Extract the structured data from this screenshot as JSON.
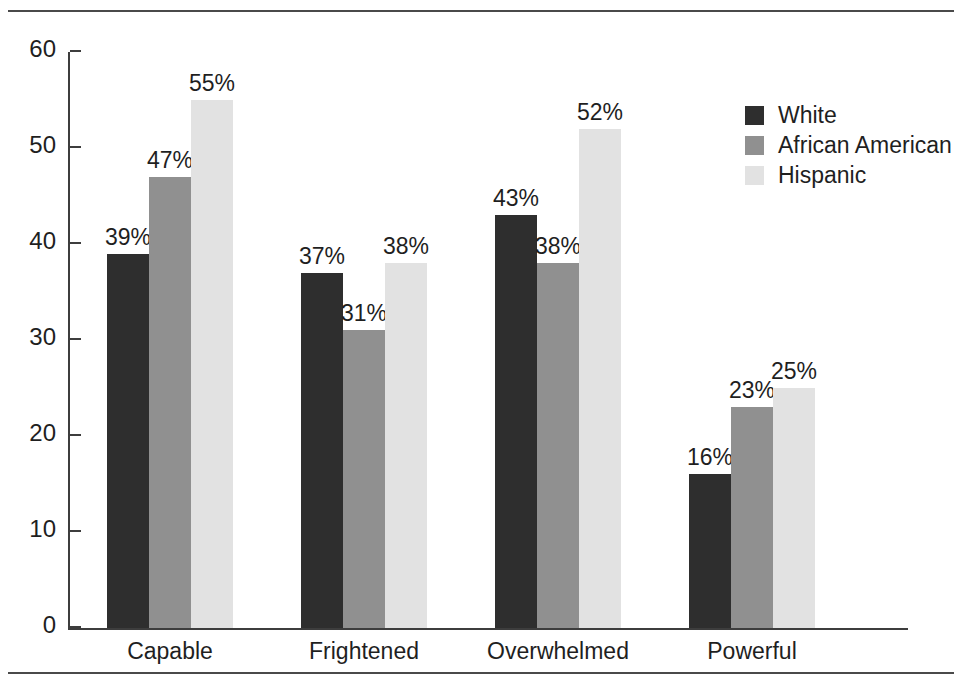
{
  "chart_data": {
    "type": "bar",
    "title": "",
    "subtitle": "",
    "xlabel": "",
    "ylabel": "",
    "ylim": [
      0,
      60
    ],
    "yticks": [
      "0",
      "10",
      "20",
      "30",
      "40",
      "50",
      "60"
    ],
    "grid": false,
    "legend_position": "top-right",
    "value_label_suffix": "%",
    "categories": [
      "Capable",
      "Frightened",
      "Overwhelmed",
      "Powerful"
    ],
    "series": [
      {
        "name": "White",
        "color": "#2e2e2e",
        "values": [
          39,
          37,
          43,
          16
        ],
        "labels": [
          "39%",
          "37%",
          "43%",
          "16%"
        ]
      },
      {
        "name": "African American",
        "color": "#909090",
        "values": [
          47,
          31,
          38,
          23
        ],
        "labels": [
          "47%",
          "31%",
          "38%",
          "23%"
        ]
      },
      {
        "name": "Hispanic",
        "color": "#e2e2e2",
        "values": [
          55,
          38,
          52,
          25
        ],
        "labels": [
          "55%",
          "38%",
          "52%",
          "25%"
        ]
      }
    ]
  },
  "axis": {
    "tick_labels": [
      "60",
      "50",
      "40",
      "30",
      "20",
      "10",
      "0"
    ]
  },
  "legend": {
    "entries": [
      {
        "label": "White",
        "color": "#2e2e2e"
      },
      {
        "label": "African American",
        "color": "#909090"
      },
      {
        "label": "Hispanic",
        "color": "#e2e2e2"
      }
    ]
  },
  "colors": {
    "axis": "#3d3d3d",
    "rule": "#4a4a4a",
    "text": "#1f1f1f",
    "background": "#ffffff"
  }
}
